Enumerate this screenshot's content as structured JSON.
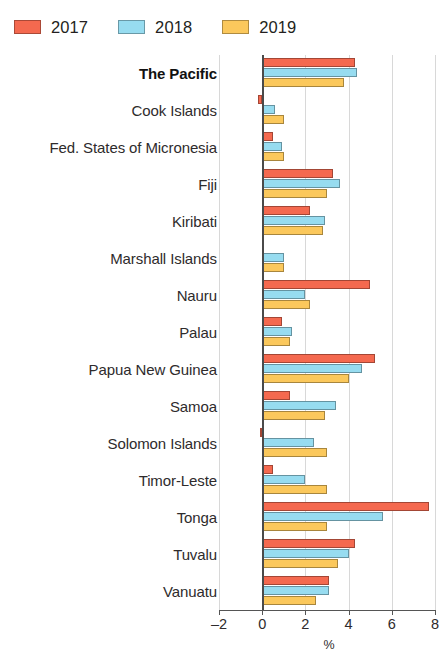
{
  "legend": {
    "items": [
      {
        "label": "2017",
        "color": "#f4694f"
      },
      {
        "label": "2018",
        "color": "#97dcf0"
      },
      {
        "label": "2019",
        "color": "#fbc champion"
      }
    ]
  },
  "axis": {
    "ticks": [
      "–2",
      "0",
      "2",
      "4",
      "6",
      "8"
    ],
    "title": "%"
  },
  "chart_data": {
    "type": "bar",
    "orientation": "horizontal",
    "title": "",
    "xlabel": "%",
    "ylabel": "",
    "xlim": [
      -2,
      8
    ],
    "xticks": [
      -2,
      0,
      2,
      4,
      6,
      8
    ],
    "xticklabels": [
      "–2",
      "0",
      "2",
      "4",
      "6",
      "8"
    ],
    "grid": true,
    "legend_position": "top-left",
    "categories": [
      "The Pacific",
      "Cook Islands",
      "Fed. States of Micronesia",
      "Fiji",
      "Kiribati",
      "Marshall Islands",
      "Nauru",
      "Palau",
      "Papua New Guinea",
      "Samoa",
      "Solomon Islands",
      "Timor-Leste",
      "Tonga",
      "Tuvalu",
      "Vanuatu"
    ],
    "highlight_category": "The Pacific",
    "series": [
      {
        "name": "2017",
        "color": "#f4694f",
        "values": [
          4.3,
          -0.2,
          0.5,
          3.3,
          2.2,
          0.0,
          5.0,
          0.9,
          5.2,
          1.3,
          -0.1,
          0.5,
          7.7,
          4.3,
          3.1
        ]
      },
      {
        "name": "2018",
        "color": "#97dcf0",
        "values": [
          4.4,
          0.6,
          0.9,
          3.6,
          2.9,
          1.0,
          2.0,
          1.4,
          4.6,
          3.4,
          2.4,
          2.0,
          5.6,
          4.0,
          3.1
        ]
      },
      {
        "name": "2019",
        "color": "#fbc85c",
        "values": [
          3.8,
          1.0,
          1.0,
          3.0,
          2.8,
          1.0,
          2.2,
          1.3,
          4.0,
          2.9,
          3.0,
          3.0,
          3.0,
          3.5,
          2.5
        ]
      }
    ]
  }
}
